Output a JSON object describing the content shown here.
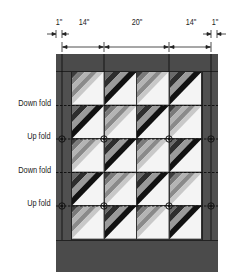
{
  "diagram": {
    "dimensions": {
      "left_margin": "1\"",
      "left_section": "14\"",
      "center_section": "20\"",
      "right_section": "14\"",
      "right_margin": "1\""
    },
    "fold_labels": [
      {
        "label": "Down fold",
        "type": "down"
      },
      {
        "label": "Up fold",
        "type": "up"
      },
      {
        "label": "Down fold",
        "type": "down"
      },
      {
        "label": "Up fold",
        "type": "up"
      }
    ],
    "blocks": {
      "columns": 4,
      "rows": 5,
      "pattern": [
        [
          "A",
          "B",
          "A",
          "B"
        ],
        [
          "B",
          "A",
          "B",
          "A"
        ],
        [
          "A",
          "B",
          "A",
          "B"
        ],
        [
          "B",
          "A",
          "B",
          "A"
        ],
        [
          "A",
          "B",
          "A",
          "B"
        ]
      ],
      "variants": {
        "A": {
          "stripes": [
            "#3c3c3c",
            "#7a7a7a",
            "#b4b4b4",
            "#8a8a8a",
            "#c8c8c8"
          ],
          "background": "#f4f4f4"
        },
        "B": {
          "stripes": [
            "#6a6a6a",
            "#2e2e2e",
            "#9a9a9a",
            "#111111"
          ],
          "background": "#f4f4f4"
        }
      }
    },
    "colors": {
      "border": "#4b4b4b",
      "line": "#111111",
      "background": "#ffffff"
    }
  }
}
